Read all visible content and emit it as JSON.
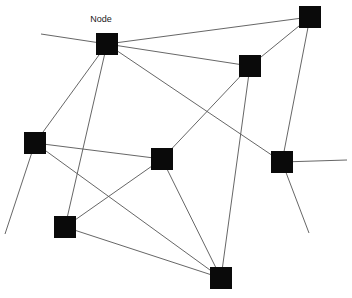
{
  "diagram": {
    "title": "",
    "type": "network-graph",
    "node_color": "#0a0a0a",
    "edge_color": "#555555",
    "node_size": 22,
    "labels": [
      {
        "id": "label-node",
        "text": "Node",
        "x": 101,
        "y": 14,
        "target": "n1"
      }
    ],
    "nodes": [
      {
        "id": "n1",
        "x": 107,
        "y": 44
      },
      {
        "id": "n2",
        "x": 310,
        "y": 17
      },
      {
        "id": "n3",
        "x": 250,
        "y": 66
      },
      {
        "id": "n4",
        "x": 35,
        "y": 143
      },
      {
        "id": "n5",
        "x": 162,
        "y": 159
      },
      {
        "id": "n6",
        "x": 282,
        "y": 162
      },
      {
        "id": "n7",
        "x": 65,
        "y": 227
      },
      {
        "id": "n8",
        "x": 221,
        "y": 278
      }
    ],
    "edges": [
      {
        "from": "n1",
        "to": "n2"
      },
      {
        "from": "n1",
        "to": "n3"
      },
      {
        "from": "n1",
        "to": "n6"
      },
      {
        "from": "n1",
        "to": "n4"
      },
      {
        "from": "n1",
        "to": "n7"
      },
      {
        "from": "n2",
        "to": "n3"
      },
      {
        "from": "n2",
        "to": "n6"
      },
      {
        "from": "n3",
        "to": "n5"
      },
      {
        "from": "n3",
        "to": "n8"
      },
      {
        "from": "n4",
        "to": "n5"
      },
      {
        "from": "n4",
        "to": "n8"
      },
      {
        "from": "n7",
        "to": "n5"
      },
      {
        "from": "n7",
        "to": "n8"
      },
      {
        "from": "n5",
        "to": "n8"
      }
    ],
    "stubs": [
      {
        "from": "n1",
        "x2": 41,
        "y2": 34
      },
      {
        "from": "n4",
        "x2": 5,
        "y2": 234
      },
      {
        "from": "n6",
        "x2": 347,
        "y2": 160
      },
      {
        "from": "n6",
        "x2": 309,
        "y2": 233
      }
    ]
  }
}
